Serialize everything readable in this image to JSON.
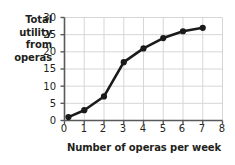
{
  "chart_data": {
    "type": "line",
    "title": "",
    "xlabel": "Number of operas per week",
    "ylabel": "Total utility from operas",
    "ylabel_lines": [
      "Total",
      "utility",
      "from",
      "operas"
    ],
    "xlim": [
      0,
      8
    ],
    "ylim": [
      0,
      30
    ],
    "xticks": [
      "0",
      "1",
      "2",
      "3",
      "4",
      "5",
      "6",
      "7",
      "8"
    ],
    "yticks": [
      "0",
      "5",
      "10",
      "15",
      "20",
      "25",
      "30"
    ],
    "xtick_values": [
      0,
      1,
      2,
      3,
      4,
      5,
      6,
      7,
      8
    ],
    "ytick_values": [
      0,
      5,
      10,
      15,
      20,
      25,
      30
    ],
    "grid": true,
    "legend": "none",
    "marker": "filled-circle",
    "line_color": "#1a1a1a",
    "grid_color": "#d6d6d6",
    "axis_color": "#58595b",
    "text_color": "#231f20",
    "x": [
      0.2,
      1,
      2,
      3,
      4,
      5,
      6,
      7
    ],
    "values": [
      1,
      3,
      7,
      17,
      21,
      24,
      26,
      27
    ],
    "points": [
      {
        "x": 0.2,
        "y": 1
      },
      {
        "x": 1,
        "y": 3
      },
      {
        "x": 2,
        "y": 7
      },
      {
        "x": 3,
        "y": 17
      },
      {
        "x": 4,
        "y": 21
      },
      {
        "x": 5,
        "y": 24
      },
      {
        "x": 6,
        "y": 26
      },
      {
        "x": 7,
        "y": 27
      }
    ],
    "series": [
      {
        "name": "Total utility from operas",
        "x": [
          0.2,
          1,
          2,
          3,
          4,
          5,
          6,
          7
        ],
        "values": [
          1,
          3,
          7,
          17,
          21,
          24,
          26,
          27
        ]
      }
    ]
  }
}
